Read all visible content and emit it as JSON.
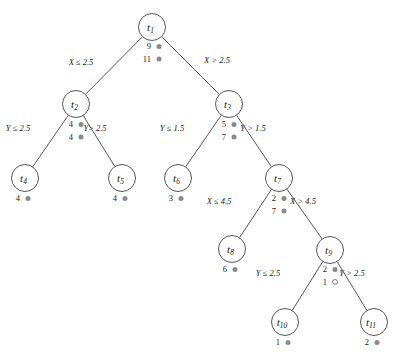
{
  "diagram": {
    "node_radius": 13.5,
    "colors": {
      "stroke": "#555555",
      "node_fill": "#ffffff",
      "text": "#1a1a1a",
      "marker_filled": "#8a8a8a",
      "marker_open_stroke": "#6f6f6f",
      "background": "#ffffff"
    },
    "nodes": [
      {
        "id": "t1",
        "label": "t",
        "subscript": "1",
        "cx": 152,
        "cy": 27
      },
      {
        "id": "t2",
        "label": "t",
        "subscript": "2",
        "cx": 76,
        "cy": 104
      },
      {
        "id": "t3",
        "label": "t",
        "subscript": "3",
        "cx": 229,
        "cy": 104
      },
      {
        "id": "t4",
        "label": "t",
        "subscript": "4",
        "cx": 25,
        "cy": 178
      },
      {
        "id": "t5",
        "label": "t",
        "subscript": "5",
        "cx": 122,
        "cy": 178
      },
      {
        "id": "t6",
        "label": "t",
        "subscript": "6",
        "cx": 178,
        "cy": 178
      },
      {
        "id": "t7",
        "label": "t",
        "subscript": "7",
        "cx": 279,
        "cy": 178
      },
      {
        "id": "t8",
        "label": "t",
        "subscript": "8",
        "cx": 232,
        "cy": 249
      },
      {
        "id": "t9",
        "label": "t",
        "subscript": "9",
        "cx": 330,
        "cy": 250
      },
      {
        "id": "t10",
        "label": "t",
        "subscript": "10",
        "cx": 285,
        "cy": 322
      },
      {
        "id": "t11",
        "label": "t",
        "subscript": "11",
        "cx": 374,
        "cy": 322
      }
    ],
    "edges": [
      {
        "id": "e-t1-t2",
        "from": "t1",
        "to": "t2",
        "label": "X ≤ 2.5",
        "label_x": 81,
        "label_y": 65
      },
      {
        "id": "e-t1-t3",
        "from": "t1",
        "to": "t3",
        "label": "X > 2.5",
        "label_x": 217,
        "label_y": 63
      },
      {
        "id": "e-t2-t4",
        "from": "t2",
        "to": "t4",
        "label": "Y ≤ 2.5",
        "label_x": 18,
        "label_y": 131
      },
      {
        "id": "e-t2-t5",
        "from": "t2",
        "to": "t5",
        "label": "Y> 2.5",
        "label_x": 95,
        "label_y": 131
      },
      {
        "id": "e-t3-t6",
        "from": "t3",
        "to": "t6",
        "label": "Y ≤ 1.5",
        "label_x": 172,
        "label_y": 131
      },
      {
        "id": "e-t3-t7",
        "from": "t3",
        "to": "t7",
        "label": "Y > 1.5",
        "label_x": 253,
        "label_y": 131
      },
      {
        "id": "e-t7-t8",
        "from": "t7",
        "to": "t8",
        "label": "X ≤ 4.5",
        "label_x": 219,
        "label_y": 204
      },
      {
        "id": "e-t7-t9",
        "from": "t7",
        "to": "t9",
        "label": "X > 4.5",
        "label_x": 303,
        "label_y": 204
      },
      {
        "id": "e-t9-t10",
        "from": "t9",
        "to": "t10",
        "label": "Y ≤ 2.5",
        "label_x": 268,
        "label_y": 276
      },
      {
        "id": "e-t9-t11",
        "from": "t9",
        "to": "t11",
        "label": "Y > 2.5",
        "label_x": 352,
        "label_y": 276
      }
    ],
    "counts": [
      {
        "id": "c-t1",
        "node": "t1",
        "rows": [
          {
            "value": "9",
            "marker": "filled"
          },
          {
            "value": "11",
            "marker": "filled"
          }
        ],
        "x": 151,
        "y": 49,
        "line_height": 12.5
      },
      {
        "id": "c-t2",
        "node": "t2",
        "rows": [
          {
            "value": "4",
            "marker": "filled"
          },
          {
            "value": "4",
            "marker": "filled"
          }
        ],
        "x": 73,
        "y": 127,
        "line_height": 12.5
      },
      {
        "id": "c-t3",
        "node": "t3",
        "rows": [
          {
            "value": "5",
            "marker": "filled"
          },
          {
            "value": "7",
            "marker": "filled"
          }
        ],
        "x": 226,
        "y": 127,
        "line_height": 12.5
      },
      {
        "id": "c-t4",
        "node": "t4",
        "rows": [
          {
            "value": "4",
            "marker": "filled"
          }
        ],
        "x": 20,
        "y": 201,
        "line_height": 12.5
      },
      {
        "id": "c-t5",
        "node": "t5",
        "rows": [
          {
            "value": "4",
            "marker": "filled"
          }
        ],
        "x": 117,
        "y": 201,
        "line_height": 12.5
      },
      {
        "id": "c-t6",
        "node": "t6",
        "rows": [
          {
            "value": "3",
            "marker": "filled"
          }
        ],
        "x": 173,
        "y": 201,
        "line_height": 12.5
      },
      {
        "id": "c-t7",
        "node": "t7",
        "rows": [
          {
            "value": "2",
            "marker": "filled"
          },
          {
            "value": "7",
            "marker": "filled"
          }
        ],
        "x": 276,
        "y": 201,
        "line_height": 12.5
      },
      {
        "id": "c-t8",
        "node": "t8",
        "rows": [
          {
            "value": "6",
            "marker": "filled"
          }
        ],
        "x": 227,
        "y": 272,
        "line_height": 12.5
      },
      {
        "id": "c-t9",
        "node": "t9",
        "rows": [
          {
            "value": "2",
            "marker": "filled"
          },
          {
            "value": "1",
            "marker": "open"
          }
        ],
        "x": 327,
        "y": 272,
        "line_height": 12.5
      },
      {
        "id": "c-t10",
        "node": "t10",
        "rows": [
          {
            "value": "1",
            "marker": "filled"
          }
        ],
        "x": 280,
        "y": 345,
        "line_height": 12.5
      },
      {
        "id": "c-t11",
        "node": "t11",
        "rows": [
          {
            "value": "2",
            "marker": "filled"
          }
        ],
        "x": 369,
        "y": 345,
        "line_height": 12.5
      }
    ]
  }
}
